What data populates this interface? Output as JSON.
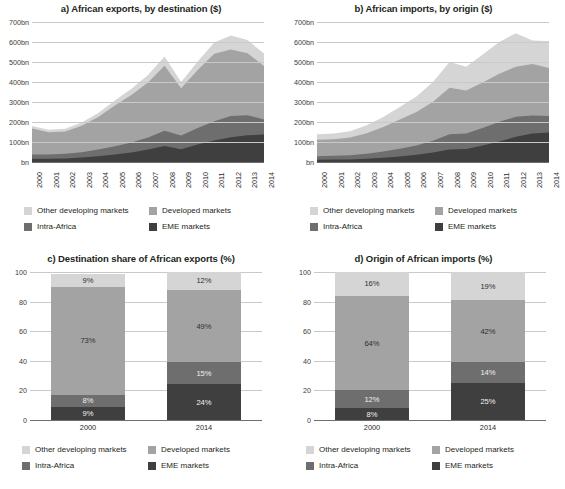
{
  "figure": {
    "palette": {
      "other_developing": "#d5d5d5",
      "developed": "#a3a3a3",
      "intra_africa": "#6e6e6e",
      "eme": "#3f3f3f",
      "gridline": "#c9c9c9",
      "axis": "#6d6d6d",
      "text": "#231f20"
    },
    "legend": {
      "items": [
        {
          "label": "Other developing markets",
          "key": "other_developing"
        },
        {
          "label": "Developed markets",
          "key": "developed"
        },
        {
          "label": "Intra-Africa",
          "key": "intra_africa"
        },
        {
          "label": "EME markets",
          "key": "eme"
        }
      ]
    }
  },
  "panels": {
    "a": {
      "title": "a) African exports, by destination ($)"
    },
    "b": {
      "title": "b) African imports, by origin ($)"
    },
    "c": {
      "title": "c) Destination share of African exports (%)"
    },
    "d": {
      "title": "d) Origin of African imports (%)"
    }
  },
  "chart_data": [
    {
      "id": "a",
      "type": "area",
      "stacked": true,
      "title": "a) African exports, by destination ($)",
      "xlabel": "",
      "ylabel": "",
      "grid": true,
      "legend_position": "bottom",
      "x": [
        2000,
        2001,
        2002,
        2003,
        2004,
        2005,
        2006,
        2007,
        2008,
        2009,
        2010,
        2011,
        2012,
        2013,
        2014
      ],
      "xticklabels": [
        "2000",
        "2001",
        "2002",
        "2003",
        "2004",
        "2005",
        "2006",
        "2007",
        "2008",
        "2009",
        "2010",
        "2011",
        "2012",
        "2013",
        "2014"
      ],
      "ylim": [
        0,
        700
      ],
      "yticks": [
        0,
        100,
        200,
        300,
        400,
        500,
        600,
        700
      ],
      "yticklabels": [
        "bn",
        "100bn",
        "200bn",
        "300bn",
        "400bn",
        "500bn",
        "600bn",
        "700bn"
      ],
      "series": [
        {
          "name": "EME markets",
          "key": "eme",
          "values": [
            16,
            16,
            18,
            22,
            29,
            38,
            48,
            62,
            80,
            64,
            88,
            108,
            124,
            134,
            137
          ]
        },
        {
          "name": "Intra-Africa",
          "key": "intra_africa",
          "values": [
            21,
            21,
            23,
            27,
            33,
            41,
            49,
            60,
            76,
            68,
            82,
            96,
            106,
            100,
            76
          ]
        },
        {
          "name": "Developed markets",
          "key": "developed",
          "values": [
            130,
            112,
            112,
            132,
            163,
            203,
            238,
            275,
            325,
            237,
            290,
            337,
            332,
            310,
            267
          ]
        },
        {
          "name": "Other developing markets",
          "key": "other_developing",
          "values": [
            13,
            12,
            13,
            16,
            20,
            26,
            31,
            38,
            47,
            31,
            43,
            57,
            71,
            66,
            62
          ]
        }
      ]
    },
    {
      "id": "b",
      "type": "area",
      "stacked": true,
      "title": "b) African imports, by origin ($)",
      "xlabel": "",
      "ylabel": "",
      "grid": true,
      "legend_position": "bottom",
      "x": [
        2000,
        2001,
        2002,
        2003,
        2004,
        2005,
        2006,
        2007,
        2008,
        2009,
        2010,
        2011,
        2012,
        2013,
        2014
      ],
      "xticklabels": [
        "2000",
        "2001",
        "2002",
        "2003",
        "2004",
        "2005",
        "2006",
        "2007",
        "2008",
        "2009",
        "2010",
        "2011",
        "2012",
        "2013",
        "2014"
      ],
      "ylim": [
        0,
        700
      ],
      "yticks": [
        0,
        100,
        200,
        300,
        400,
        500,
        600,
        700
      ],
      "yticklabels": [
        "bn",
        "100bn",
        "200bn",
        "300bn",
        "400bn",
        "500bn",
        "600bn",
        "700bn"
      ],
      "series": [
        {
          "name": "EME markets",
          "key": "eme",
          "values": [
            11,
            12,
            13,
            16,
            21,
            28,
            36,
            48,
            63,
            65,
            82,
            103,
            126,
            142,
            147
          ]
        },
        {
          "name": "Intra-Africa",
          "key": "intra_africa",
          "values": [
            18,
            19,
            21,
            25,
            31,
            38,
            46,
            58,
            76,
            78,
            88,
            98,
            100,
            90,
            83
          ]
        },
        {
          "name": "Developed markets",
          "key": "developed",
          "values": [
            82,
            83,
            88,
            103,
            123,
            146,
            168,
            195,
            232,
            215,
            228,
            240,
            250,
            258,
            240
          ]
        },
        {
          "name": "Other developing markets",
          "key": "other_developing",
          "values": [
            28,
            29,
            32,
            40,
            50,
            63,
            78,
            99,
            129,
            118,
            140,
            159,
            168,
            117,
            135
          ]
        }
      ]
    },
    {
      "id": "c",
      "type": "bar",
      "stacked": true,
      "title": "c) Destination share of African exports (%)",
      "xlabel": "",
      "ylabel": "",
      "grid": true,
      "legend_position": "bottom",
      "categories": [
        "2000",
        "2014"
      ],
      "ylim": [
        0,
        100
      ],
      "yticks": [
        0,
        20,
        40,
        60,
        80,
        100
      ],
      "yticklabels": [
        "0",
        "20",
        "40",
        "60",
        "80",
        "100"
      ],
      "series": [
        {
          "name": "EME markets",
          "key": "eme",
          "values": [
            9,
            24
          ],
          "labels": [
            "9%",
            "24%"
          ]
        },
        {
          "name": "Intra-Africa",
          "key": "intra_africa",
          "values": [
            8,
            15
          ],
          "labels": [
            "8%",
            "15%"
          ]
        },
        {
          "name": "Developed markets",
          "key": "developed",
          "values": [
            73,
            49
          ],
          "labels": [
            "73%",
            "49%"
          ]
        },
        {
          "name": "Other developing markets",
          "key": "other_developing",
          "values": [
            9,
            12
          ],
          "labels": [
            "9%",
            "12%"
          ]
        }
      ]
    },
    {
      "id": "d",
      "type": "bar",
      "stacked": true,
      "title": "d) Origin of African imports (%)",
      "xlabel": "",
      "ylabel": "",
      "grid": true,
      "legend_position": "bottom",
      "categories": [
        "2000",
        "2014"
      ],
      "ylim": [
        0,
        100
      ],
      "yticks": [
        0,
        20,
        40,
        60,
        80,
        100
      ],
      "yticklabels": [
        "0",
        "20",
        "40",
        "60",
        "80",
        "100"
      ],
      "series": [
        {
          "name": "EME markets",
          "key": "eme",
          "values": [
            8,
            25
          ],
          "labels": [
            "8%",
            "25%"
          ]
        },
        {
          "name": "Intra-Africa",
          "key": "intra_africa",
          "values": [
            12,
            14
          ],
          "labels": [
            "12%",
            "14%"
          ]
        },
        {
          "name": "Developed markets",
          "key": "developed",
          "values": [
            64,
            42
          ],
          "labels": [
            "64%",
            "42%"
          ]
        },
        {
          "name": "Other developing markets",
          "key": "other_developing",
          "values": [
            16,
            19
          ],
          "labels": [
            "16%",
            "19%"
          ]
        }
      ]
    }
  ]
}
